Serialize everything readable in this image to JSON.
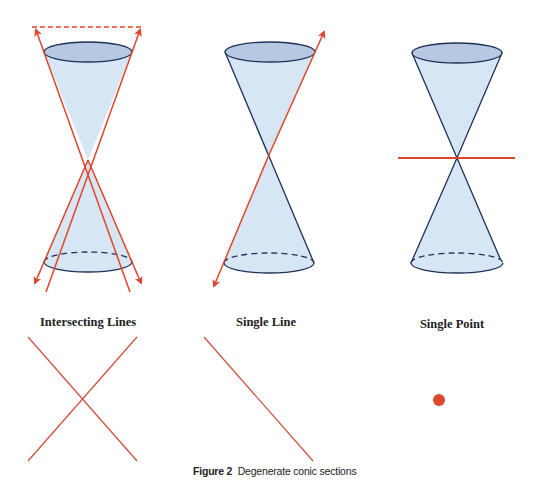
{
  "figure": {
    "caption_label": "Figure 2",
    "caption_text": "Degenerate conic sections",
    "panels": [
      {
        "id": "intersecting-lines",
        "title": "Intersecting Lines"
      },
      {
        "id": "single-line",
        "title": "Single Line"
      },
      {
        "id": "single-point",
        "title": "Single Point"
      }
    ]
  },
  "colors": {
    "cone_fill": "#d7e6f5",
    "cone_top_fill": "#b7c9e2",
    "cone_outline": "#1f3158",
    "plane_red": "#e0442c"
  }
}
